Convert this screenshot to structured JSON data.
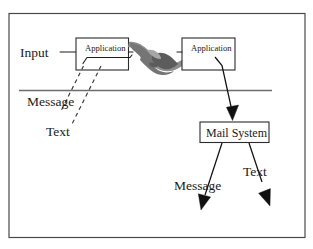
{
  "figure": {
    "frame": {
      "name": "figure-border"
    },
    "colors": {
      "background": "#ffffff",
      "frame_stroke": "#4a4a4a",
      "box_stroke": "#2b2b2b",
      "divider_stroke": "#6d6d6d",
      "arrow_fill": "#111111",
      "dashed_stroke": "#3a3a3a",
      "handshake_gray": "#8d8d8d"
    },
    "boxes": [
      {
        "id": "application-left",
        "label": "Application"
      },
      {
        "id": "application-right",
        "label": "Application"
      },
      {
        "id": "mail-system",
        "label": "Mail System"
      }
    ],
    "labels": {
      "input": "Input",
      "message_upper": "Message",
      "text_upper": "Text",
      "message_lower": "Message",
      "text_lower": "Text"
    },
    "graphics": [
      {
        "id": "handshake",
        "name": "handshake-illustration"
      }
    ],
    "connectors": [
      {
        "id": "input-connector",
        "from": "Input",
        "to": "Application"
      },
      {
        "id": "peer-connector-left",
        "from": "Application",
        "to": "handshake"
      },
      {
        "id": "peer-connector-right",
        "from": "handshake",
        "to": "Application"
      },
      {
        "id": "message-dashed",
        "from": "Application",
        "to": "Message"
      },
      {
        "id": "text-dashed",
        "from": "Application",
        "to": "Text"
      },
      {
        "id": "app-to-mail-arrow",
        "from": "Application",
        "to": "Mail System"
      },
      {
        "id": "mail-message-arrow",
        "from": "Mail System",
        "to": "Message"
      },
      {
        "id": "mail-text-arrow",
        "from": "Mail System",
        "to": "Text"
      }
    ]
  }
}
